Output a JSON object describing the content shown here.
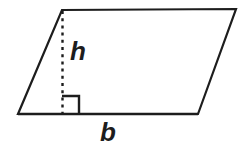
{
  "figure": {
    "name": "parallelogram-area-diagram",
    "type": "geometry-diagram",
    "shape": "parallelogram",
    "background_color": "#ffffff",
    "stroke_color": "#1d1d1d",
    "stroke_width": 2,
    "labels": {
      "height": "h",
      "base": "b"
    },
    "vertices": {
      "top_left": [
        62,
        10
      ],
      "top_right": [
        236,
        9
      ],
      "bottom_right": [
        198,
        114
      ],
      "bottom_left": [
        18,
        114
      ]
    },
    "height_segment": {
      "label": "h",
      "style": "dashed",
      "dash_pattern": "3 4",
      "from": [
        62,
        11
      ],
      "to": [
        62,
        114
      ]
    },
    "base_segment": {
      "label": "b",
      "from": [
        18,
        114
      ],
      "to": [
        198,
        114
      ]
    },
    "right_angle_marker": {
      "name": "right-angle-square",
      "x": 62,
      "y": 96,
      "size": 17
    }
  }
}
